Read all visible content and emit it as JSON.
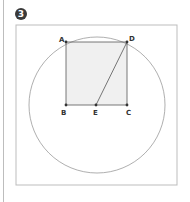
{
  "figure": {
    "number": "3",
    "colors": {
      "frame": "#bdbdbd",
      "circle": "#9a9a9a",
      "square_fill": "#f0f0f0",
      "square_stroke": "#555555",
      "point": "#333333"
    },
    "frame": {
      "x": 16,
      "y": 25,
      "w": 161,
      "h": 160
    },
    "circle": {
      "cx": 97,
      "cy": 105,
      "r": 68
    },
    "points": [
      {
        "name": "A",
        "x": 66,
        "y": 42,
        "lx": 59,
        "ly": 42
      },
      {
        "name": "D",
        "x": 127,
        "y": 42,
        "lx": 129,
        "ly": 41
      },
      {
        "name": "B",
        "x": 66,
        "y": 105,
        "lx": 61,
        "ly": 115
      },
      {
        "name": "E",
        "x": 96,
        "y": 105,
        "lx": 93,
        "ly": 115
      },
      {
        "name": "C",
        "x": 127,
        "y": 105,
        "lx": 126,
        "ly": 115
      }
    ],
    "segments": [
      [
        "A",
        "D"
      ],
      [
        "D",
        "C"
      ],
      [
        "C",
        "B"
      ],
      [
        "B",
        "A"
      ],
      [
        "D",
        "E"
      ]
    ]
  }
}
